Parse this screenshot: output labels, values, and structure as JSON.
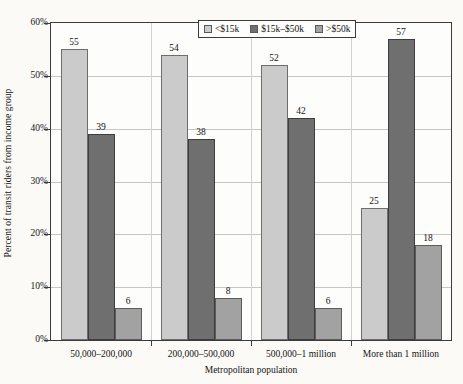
{
  "chart_data": {
    "type": "bar",
    "title": "",
    "xlabel": "Metropolitan population",
    "ylabel": "Percent of transit riders from income group",
    "categories": [
      "50,000–200,000",
      "200,000–500,000",
      "500,000–1 million",
      "More than 1 million"
    ],
    "series": [
      {
        "name": "<$15k",
        "color": "#cbcbcb",
        "values": [
          55,
          54,
          52,
          25
        ]
      },
      {
        "name": "$15k–$50k",
        "color": "#6f6f6f",
        "values": [
          39,
          38,
          42,
          57
        ]
      },
      {
        "name": ">$50k",
        "color": "#a2a2a2",
        "values": [
          6,
          8,
          6,
          18
        ]
      }
    ],
    "ylim": [
      0,
      60
    ],
    "yticks": [
      "0%",
      "10%",
      "20%",
      "30%",
      "40%",
      "50%",
      "60%"
    ],
    "ytick_values": [
      0,
      10,
      20,
      30,
      40,
      50,
      60
    ],
    "grid": true,
    "legend_position": "top-center",
    "value_labels": [
      55,
      39,
      6,
      54,
      38,
      8,
      52,
      42,
      6,
      25,
      57,
      18
    ]
  },
  "legend": {
    "items": [
      {
        "label": "<$15k"
      },
      {
        "label": "$15k–$50k"
      },
      {
        "label": ">$50k"
      }
    ]
  }
}
